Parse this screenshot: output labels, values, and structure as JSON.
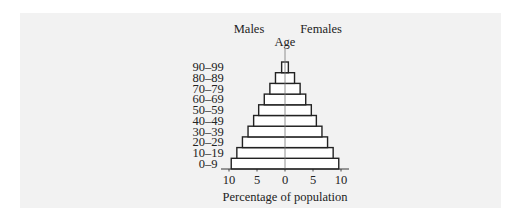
{
  "chart_data": {
    "type": "bar",
    "orientation": "horizontal",
    "subtype": "population-pyramid",
    "title": "",
    "xlabel": "Percentage of population",
    "ylabel": "Age",
    "left_group_label": "Males",
    "right_group_label": "Females",
    "categories": [
      "0–9",
      "10–19",
      "20–29",
      "30–39",
      "40–49",
      "50–59",
      "60–69",
      "70–79",
      "80–89",
      "90–99"
    ],
    "series": [
      {
        "name": "Males",
        "values": [
          9.6,
          8.6,
          7.6,
          6.6,
          5.6,
          4.7,
          3.7,
          2.7,
          1.7,
          0.6
        ]
      },
      {
        "name": "Females",
        "values": [
          9.6,
          8.6,
          7.6,
          6.6,
          5.6,
          4.7,
          3.7,
          2.7,
          1.7,
          0.6
        ]
      }
    ],
    "xticks": [
      {
        "value": -10,
        "label": "10"
      },
      {
        "value": -5,
        "label": "5"
      },
      {
        "value": 0,
        "label": "0"
      },
      {
        "value": 5,
        "label": "5"
      },
      {
        "value": 10,
        "label": "10"
      }
    ],
    "xlim": [
      -11,
      11
    ],
    "grid": false,
    "legend": "none",
    "colors": {
      "bar_fill": "#ffffff",
      "bar_stroke": "#222222",
      "panel_bg": "#f2f2f2"
    }
  },
  "labels": {
    "males": "Males",
    "females": "Females",
    "age": "Age",
    "xlabel": "Percentage of population"
  }
}
